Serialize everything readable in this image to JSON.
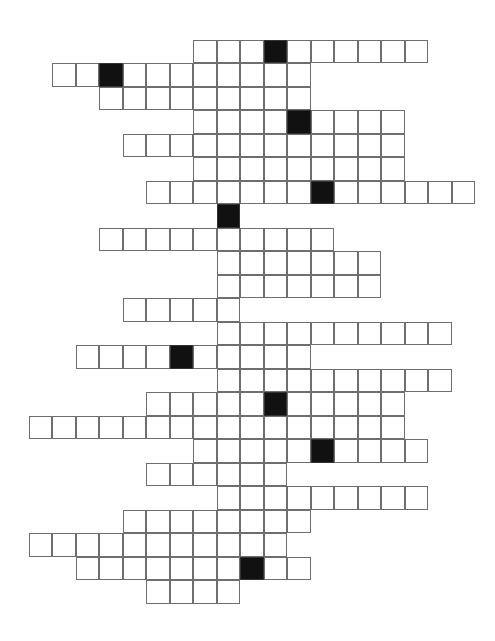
{
  "puzzle": {
    "type": "crossword",
    "rows": [
      {
        "row": 0,
        "start_col": 8,
        "end_col": 17,
        "blocks": [
          11
        ]
      },
      {
        "row": 1,
        "start_col": 2,
        "end_col": 12,
        "blocks": [
          4
        ]
      },
      {
        "row": 2,
        "start_col": 4,
        "end_col": 12,
        "blocks": []
      },
      {
        "row": 3,
        "start_col": 8,
        "end_col": 16,
        "blocks": [
          12
        ]
      },
      {
        "row": 4,
        "start_col": 5,
        "end_col": 16,
        "blocks": []
      },
      {
        "row": 5,
        "start_col": 8,
        "end_col": 16,
        "blocks": []
      },
      {
        "row": 6,
        "start_col": 6,
        "end_col": 19,
        "blocks": [
          13
        ]
      },
      {
        "row": 7,
        "start_col": 9,
        "end_col": 9,
        "blocks": [
          9
        ]
      },
      {
        "row": 8,
        "start_col": 4,
        "end_col": 13,
        "blocks": []
      },
      {
        "row": 9,
        "start_col": 9,
        "end_col": 15,
        "blocks": []
      },
      {
        "row": 10,
        "start_col": 9,
        "end_col": 15,
        "blocks": []
      },
      {
        "row": 11,
        "start_col": 5,
        "end_col": 9,
        "blocks": []
      },
      {
        "row": 12,
        "start_col": 9,
        "end_col": 18,
        "blocks": []
      },
      {
        "row": 13,
        "start_col": 3,
        "end_col": 12,
        "blocks": [
          7
        ]
      },
      {
        "row": 14,
        "start_col": 9,
        "end_col": 18,
        "blocks": []
      },
      {
        "row": 15,
        "start_col": 6,
        "end_col": 16,
        "blocks": [
          11
        ]
      },
      {
        "row": 16,
        "start_col": 1,
        "end_col": 16,
        "blocks": []
      },
      {
        "row": 17,
        "start_col": 8,
        "end_col": 17,
        "blocks": [
          13
        ]
      },
      {
        "row": 18,
        "start_col": 6,
        "end_col": 11,
        "blocks": []
      },
      {
        "row": 19,
        "start_col": 9,
        "end_col": 17,
        "blocks": []
      },
      {
        "row": 20,
        "start_col": 5,
        "end_col": 12,
        "blocks": []
      },
      {
        "row": 21,
        "start_col": 1,
        "end_col": 11,
        "blocks": []
      },
      {
        "row": 22,
        "start_col": 3,
        "end_col": 12,
        "blocks": [
          10
        ]
      },
      {
        "row": 23,
        "start_col": 6,
        "end_col": 9,
        "blocks": []
      }
    ],
    "colors": {
      "cell": "#ffffff",
      "block": "#111111",
      "border": "#6e6e6e"
    }
  }
}
